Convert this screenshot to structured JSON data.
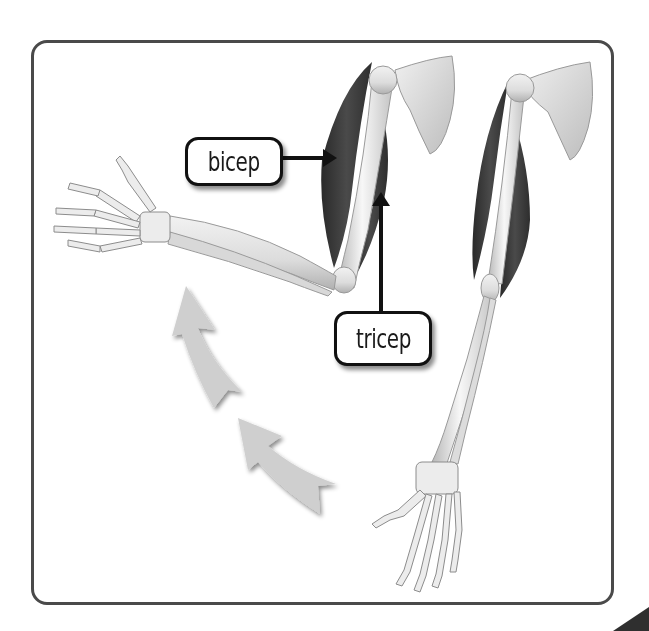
{
  "diagram": {
    "labels": {
      "bicep": "bicep",
      "tricep": "tricep"
    },
    "icons": [
      "curved-motion-arrow-icon",
      "label-pointer-arrow-icon"
    ],
    "colors": {
      "frame_border": "#4a4a4a",
      "muscle": "#3a3a3a",
      "bone": "#e8e8e8",
      "motion_arrow": "#cfcfcf",
      "label_border": "#111111"
    }
  }
}
